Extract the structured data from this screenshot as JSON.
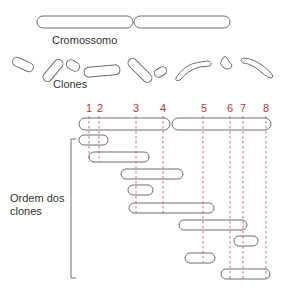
{
  "labels": {
    "chromosome": "Cromossomo",
    "clones": "Clones",
    "clone_order_line1": "Ordem dos",
    "clone_order_line2": "clones"
  },
  "markers": [
    {
      "label": "1",
      "x": 89
    },
    {
      "label": "2",
      "x": 99
    },
    {
      "label": "3",
      "x": 136
    },
    {
      "label": "4",
      "x": 163
    },
    {
      "label": "5",
      "x": 203
    },
    {
      "label": "6",
      "x": 230
    },
    {
      "label": "7",
      "x": 243
    },
    {
      "label": "8",
      "x": 266
    }
  ],
  "colors": {
    "outline": "#6e6e6e",
    "marker": "#b03a3a",
    "text": "#333333"
  },
  "ordered_clones": [
    {
      "x1": 79,
      "x2": 108,
      "y": 140
    },
    {
      "x1": 89,
      "x2": 149,
      "y": 157
    },
    {
      "x1": 121,
      "x2": 183,
      "y": 174
    },
    {
      "x1": 128,
      "x2": 153,
      "y": 190
    },
    {
      "x1": 129,
      "x2": 214,
      "y": 208
    },
    {
      "x1": 179,
      "x2": 247,
      "y": 225
    },
    {
      "x1": 234,
      "x2": 258,
      "y": 241
    },
    {
      "x1": 185,
      "x2": 215,
      "y": 258
    },
    {
      "x1": 221,
      "x2": 270,
      "y": 274
    }
  ]
}
